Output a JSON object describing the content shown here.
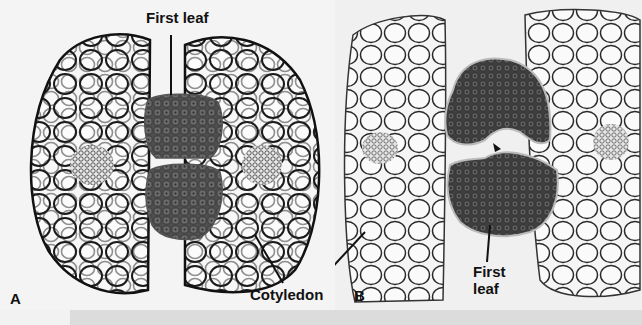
{
  "figure": {
    "panels": [
      {
        "id": "A",
        "letter": "A",
        "description": "Cross section through seed showing first leaf enclosed between cotyledons"
      },
      {
        "id": "B",
        "letter": "B",
        "description": "Cross section showing first leaf with arrowhead marking apex"
      }
    ],
    "labels": {
      "first_leaf_a": "First leaf",
      "cotyledon": "Cotyledon",
      "first_leaf_b_line1": "First",
      "first_leaf_b_line2": "leaf"
    },
    "colors": {
      "background": "#f4f4f4",
      "cell_wall": "#1a1a1a",
      "leaf_tissue": "#5a5a5a",
      "label_text": "#111111"
    }
  }
}
